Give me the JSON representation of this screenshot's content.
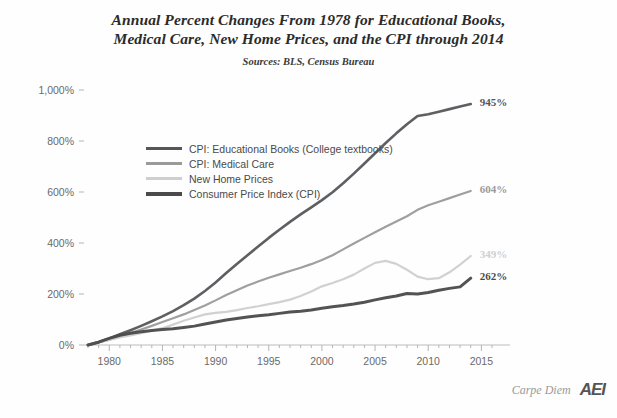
{
  "title": {
    "line1": "Annual Percent Changes From 1978 for Educational Books,",
    "line2": "Medical Care, New Home Prices, and the CPI through 2014",
    "subtitle": "Sources: BLS, Census Bureau"
  },
  "footer": {
    "blog": "Carpe Diem",
    "org": "AEI"
  },
  "chart_data": {
    "type": "line",
    "title": "Annual Percent Changes From 1978 for Educational Books, Medical Care, New Home Prices, and the CPI through 2014",
    "subtitle": "Sources: BLS, Census Bureau",
    "xlabel": "",
    "ylabel": "",
    "xlim": [
      1978,
      2016
    ],
    "ylim": [
      0,
      1000
    ],
    "grid": false,
    "legend_position": "inside-upper-left",
    "xticks": [
      1980,
      1985,
      1990,
      1995,
      2000,
      2005,
      2010,
      2015
    ],
    "xtick_labels": [
      "1980",
      "1985",
      "1990",
      "1995",
      "2000",
      "2005",
      "2010",
      "2015"
    ],
    "x_minor_tick_step": 1,
    "yticks": [
      0,
      200,
      400,
      600,
      800,
      1000
    ],
    "ytick_labels": [
      "0%",
      "200%",
      "400%",
      "600%",
      "800%",
      "1,000%"
    ],
    "x": [
      1978,
      1979,
      1980,
      1981,
      1982,
      1983,
      1984,
      1985,
      1986,
      1987,
      1988,
      1989,
      1990,
      1991,
      1992,
      1993,
      1994,
      1995,
      1996,
      1997,
      1998,
      1999,
      2000,
      2001,
      2002,
      2003,
      2004,
      2005,
      2006,
      2007,
      2008,
      2009,
      2010,
      2011,
      2012,
      2013,
      2014
    ],
    "series": [
      {
        "name": "CPI: Educational Books  (College textbooks)",
        "legend_label": "CPI: Educational Books  (College textbooks)",
        "color": "#55565a",
        "width": 2.6,
        "end_label": "945%",
        "end_value": 945,
        "values": [
          0,
          12,
          26,
          42,
          58,
          75,
          93,
          112,
          133,
          156,
          182,
          212,
          245,
          282,
          318,
          352,
          386,
          420,
          452,
          483,
          512,
          540,
          568,
          599,
          634,
          672,
          712,
          752,
          792,
          830,
          866,
          898,
          905,
          915,
          925,
          935,
          945
        ]
      },
      {
        "name": "CPI: Medical Care",
        "legend_label": "CPI: Medical Care",
        "color": "#9a9a9a",
        "width": 2.2,
        "end_label": "604%",
        "end_value": 604,
        "values": [
          0,
          10,
          21,
          34,
          47,
          61,
          75,
          90,
          105,
          120,
          137,
          155,
          175,
          196,
          215,
          233,
          249,
          264,
          277,
          290,
          303,
          317,
          333,
          352,
          375,
          398,
          420,
          442,
          464,
          484,
          505,
          530,
          548,
          562,
          576,
          590,
          604
        ]
      },
      {
        "name": "New Home Prices",
        "legend_label": "New Home Prices",
        "color": "#cfcfcf",
        "width": 2.2,
        "end_label": "349%",
        "end_value": 349,
        "values": [
          0,
          11,
          20,
          30,
          38,
          46,
          56,
          66,
          80,
          95,
          108,
          120,
          126,
          130,
          137,
          145,
          152,
          160,
          168,
          178,
          192,
          210,
          230,
          243,
          258,
          276,
          300,
          322,
          330,
          318,
          295,
          268,
          258,
          262,
          285,
          315,
          349
        ]
      },
      {
        "name": "Consumer Price Index (CPI)",
        "legend_label": "Consumer Price Index (CPI)",
        "color": "#4a4a4a",
        "width": 3.0,
        "end_label": "262%",
        "end_value": 262,
        "values": [
          0,
          11,
          26,
          38,
          46,
          52,
          57,
          61,
          64,
          69,
          74,
          82,
          90,
          98,
          104,
          110,
          115,
          119,
          124,
          129,
          132,
          137,
          144,
          150,
          155,
          161,
          168,
          177,
          185,
          192,
          202,
          200,
          206,
          215,
          222,
          228,
          262
        ]
      }
    ]
  }
}
